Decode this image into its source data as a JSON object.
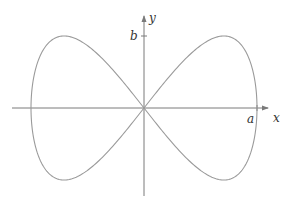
{
  "figure": {
    "type": "parametric-curve",
    "labels": {
      "x_axis": "x",
      "y_axis": "y",
      "a_tick": "a",
      "b_tick": "b"
    },
    "geometry": {
      "origin": [
        144,
        108
      ],
      "a_px": 113,
      "b_px": 72,
      "x_axis_range": [
        12,
        270
      ],
      "y_axis_range": [
        196,
        14
      ]
    },
    "colors": {
      "axis": "#7a7a7a",
      "curve": "#9a9a9a",
      "text": "#333333"
    }
  }
}
